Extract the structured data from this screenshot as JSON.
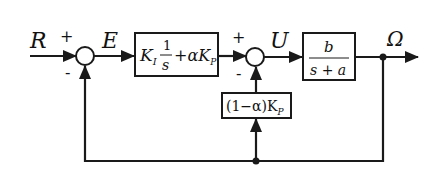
{
  "diagram": {
    "type": "block-diagram",
    "signals": {
      "reference": "R",
      "error": "E",
      "control": "U",
      "output": "Ω"
    },
    "summing_junctions": [
      {
        "id": "sum1",
        "plus_sign": "+",
        "minus_sign": "-"
      },
      {
        "id": "sum2",
        "plus_sign": "+",
        "minus_sign": "-"
      }
    ],
    "blocks": {
      "pi_controller": {
        "gain_ki": "K",
        "ki_sub": "I",
        "frac_num": "1",
        "frac_den": "s",
        "plus_term": "+αK",
        "kp_sub": "P"
      },
      "plant": {
        "numerator": "b",
        "denominator": "s + a"
      },
      "inner_feedback": {
        "label": "(1−α)K",
        "kp_sub": "P"
      }
    }
  }
}
